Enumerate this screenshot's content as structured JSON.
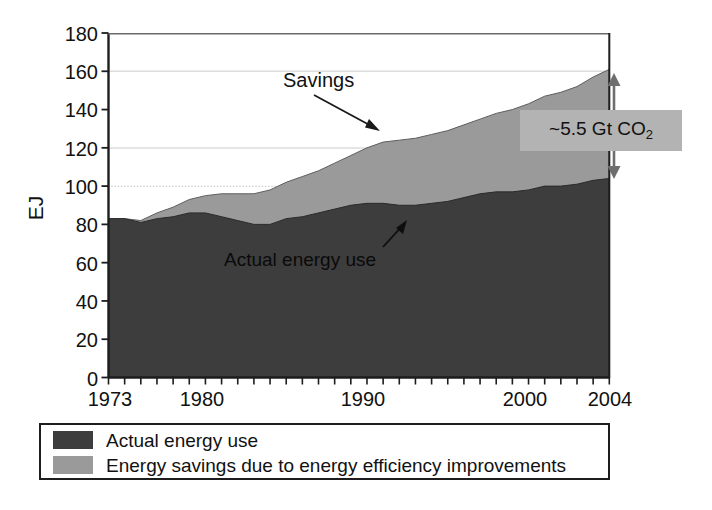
{
  "chart_data": {
    "type": "area",
    "title": "",
    "subtitle": "",
    "xlabel": "",
    "ylabel": "EJ",
    "stacked": true,
    "grid": true,
    "legend_position": "bottom",
    "xlim": [
      1973,
      2004
    ],
    "ylim": [
      0,
      180
    ],
    "ytick_labels": [
      "0",
      "20",
      "40",
      "60",
      "80",
      "100",
      "120",
      "140",
      "160",
      "180"
    ],
    "ytick_values": [
      0,
      20,
      40,
      60,
      80,
      100,
      120,
      140,
      160,
      180
    ],
    "xtick_labels": [
      "1973",
      "1980",
      "1990",
      "2000",
      "2004"
    ],
    "xtick_values": [
      1973,
      1980,
      1990,
      2000,
      2004
    ],
    "x": [
      1973,
      1974,
      1975,
      1976,
      1977,
      1978,
      1979,
      1980,
      1981,
      1982,
      1983,
      1984,
      1985,
      1986,
      1987,
      1988,
      1989,
      1990,
      1991,
      1992,
      1993,
      1994,
      1995,
      1996,
      1997,
      1998,
      1999,
      2000,
      2001,
      2002,
      2003,
      2004
    ],
    "series": [
      {
        "name": "Actual energy use",
        "color": "#3d3d3d",
        "values": [
          83,
          83,
          81,
          83,
          84,
          86,
          86,
          84,
          82,
          80,
          80,
          83,
          84,
          86,
          88,
          90,
          91,
          91,
          90,
          90,
          91,
          92,
          94,
          96,
          97,
          97,
          98,
          100,
          100,
          101,
          103,
          104
        ]
      },
      {
        "name": "Energy savings due to energy efficiency improvements",
        "color": "#9a9a9a",
        "values": [
          0,
          0,
          1,
          3,
          5,
          7,
          9,
          12,
          14,
          16,
          18,
          19,
          21,
          22,
          24,
          26,
          29,
          32,
          34,
          35,
          36,
          37,
          38,
          39,
          41,
          43,
          45,
          47,
          49,
          51,
          54,
          57
        ]
      }
    ],
    "totals": [
      83,
      83,
      82,
      86,
      89,
      93,
      95,
      96,
      96,
      96,
      98,
      102,
      105,
      108,
      112,
      116,
      120,
      123,
      124,
      125,
      127,
      129,
      132,
      135,
      138,
      140,
      143,
      147,
      149,
      152,
      157,
      161
    ],
    "annotations": [
      {
        "name": "savings-callout",
        "text": "Savings",
        "arrow": true
      },
      {
        "name": "actual-energy-callout",
        "text": "Actual energy use",
        "arrow": true
      },
      {
        "name": "co2-callout",
        "text": "~5.5 Gt CO",
        "subscript": "2",
        "arrow": "double-vertical"
      }
    ]
  },
  "axes": {
    "ylabel": "EJ",
    "yticks": [
      "180",
      "160",
      "140",
      "120",
      "100",
      "80",
      "60",
      "40",
      "20",
      "0"
    ],
    "xticks": [
      "1973",
      "1980",
      "1990",
      "2000",
      "2004"
    ]
  },
  "annotations": {
    "savings": "Savings",
    "actual_energy_use": "Actual energy use",
    "co2_value": "~5.5 Gt CO",
    "co2_subscript": "2"
  },
  "legend": {
    "items": [
      {
        "label": "Actual energy use",
        "color": "#3d3d3d"
      },
      {
        "label": "Energy savings due to energy efficiency improvements",
        "color": "#9a9a9a"
      }
    ]
  },
  "colors": {
    "actual_energy": "#3d3d3d",
    "savings": "#9a9a9a",
    "axis": "#1d1d1d",
    "gridline": "#d9d9d9",
    "co2_box": "#b3b3b3"
  }
}
